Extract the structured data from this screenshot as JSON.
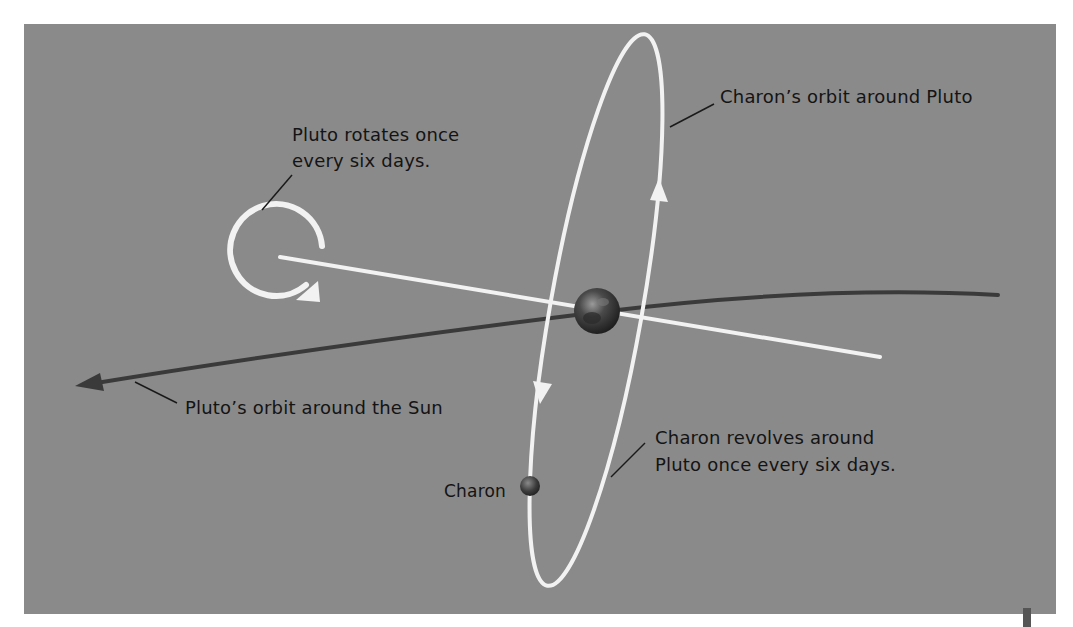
{
  "diagram": {
    "colors": {
      "background": "#8a8a8a",
      "paths": "#f2f2f2",
      "pluto_orbit": "#3a3a3a",
      "text": "#141414"
    },
    "labels": {
      "rotation": [
        "Pluto rotates once",
        "every six days."
      ],
      "charon_orbit": "Charon’s orbit around Pluto",
      "pluto_orbit": "Pluto’s orbit around the Sun",
      "charon_revolves": [
        "Charon revolves around",
        "Pluto once every six days."
      ],
      "charon": "Charon"
    },
    "bodies": [
      {
        "name": "Pluto",
        "cx": 597,
        "cy": 311,
        "r": 23
      },
      {
        "name": "Charon",
        "cx": 530,
        "cy": 486,
        "r": 10
      }
    ],
    "icons": {
      "rotation_arrow": "circular-arrow",
      "orbit_direction": "arrowhead"
    }
  }
}
